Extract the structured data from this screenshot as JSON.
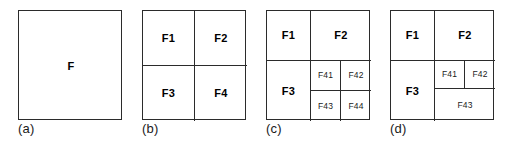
{
  "figure": {
    "type": "quadtree-subdivision-diagram",
    "panel_count": 4,
    "stroke_color": "#2b2b2b",
    "background_color": "#ffffff",
    "text_color": "#000000"
  },
  "panels": [
    {
      "id": "a",
      "caption": "(a)",
      "cells": [
        {
          "key": "f",
          "label": "F",
          "size": "large"
        }
      ]
    },
    {
      "id": "b",
      "caption": "(b)",
      "cells": [
        {
          "key": "f1",
          "label": "F1",
          "size": "large"
        },
        {
          "key": "f2",
          "label": "F2",
          "size": "large"
        },
        {
          "key": "f3",
          "label": "F3",
          "size": "large"
        },
        {
          "key": "f4",
          "label": "F4",
          "size": "large"
        }
      ]
    },
    {
      "id": "c",
      "caption": "(c)",
      "cells": [
        {
          "key": "f1",
          "label": "F1",
          "size": "large"
        },
        {
          "key": "f2",
          "label": "F2",
          "size": "large"
        },
        {
          "key": "f3",
          "label": "F3",
          "size": "large"
        },
        {
          "key": "f41",
          "label": "F41",
          "size": "small"
        },
        {
          "key": "f42",
          "label": "F42",
          "size": "small"
        },
        {
          "key": "f43",
          "label": "F43",
          "size": "small"
        },
        {
          "key": "f44",
          "label": "F44",
          "size": "small"
        }
      ]
    },
    {
      "id": "d",
      "caption": "(d)",
      "cells": [
        {
          "key": "f1",
          "label": "F1",
          "size": "large"
        },
        {
          "key": "f2",
          "label": "F2",
          "size": "large"
        },
        {
          "key": "f3",
          "label": "F3",
          "size": "large"
        },
        {
          "key": "f41",
          "label": "F41",
          "size": "small"
        },
        {
          "key": "f42",
          "label": "F42",
          "size": "small"
        },
        {
          "key": "f43",
          "label": "F43",
          "size": "small"
        }
      ]
    }
  ]
}
